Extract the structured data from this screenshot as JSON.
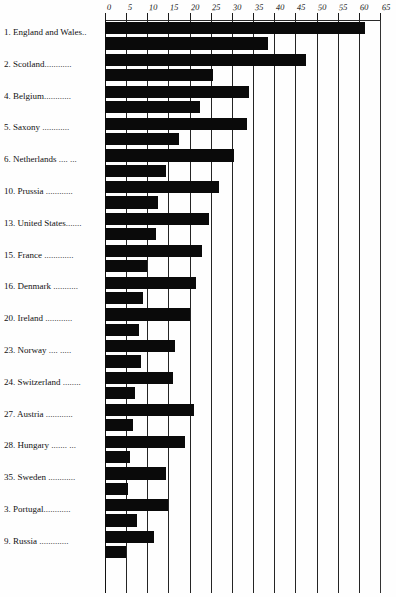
{
  "chart_data": {
    "type": "bar",
    "orientation": "horizontal",
    "title": "",
    "subtitle": "",
    "xlabel": "",
    "ylabel": "",
    "xlim": [
      0,
      65
    ],
    "grid": true,
    "legend_position": "none",
    "axis_ticks": [
      0,
      5,
      10,
      15,
      20,
      25,
      30,
      35,
      40,
      45,
      50,
      55,
      60,
      65
    ],
    "tick_labels": [
      "0",
      "5",
      "10",
      "15",
      "20",
      "25",
      "30",
      "35",
      "40",
      "45",
      "50",
      "55",
      "60",
      "65"
    ],
    "categories": [
      "England and Wales..",
      "Scotland............",
      "Belgium............",
      "Saxony ............",
      "Netherlands .... ...",
      "Prussia ............",
      "United States.......",
      "France .............",
      "Denmark ...........",
      "Ireland ............",
      "Norway .... .....",
      "Switzerland ........",
      "Austria ............",
      "Hungary ....... ...",
      "Sweden ............",
      "Portugal............",
      "Russia ............."
    ],
    "rank_numbers": [
      "1.",
      "2.",
      "4.",
      "5.",
      "6.",
      "10.",
      "13.",
      "15.",
      "16.",
      "20.",
      "23.",
      "24.",
      "27.",
      "28.",
      "35.",
      "3.",
      "9."
    ],
    "series": [
      {
        "name": "upper",
        "values": [
          61.5,
          47.5,
          34.0,
          33.5,
          30.5,
          27.0,
          24.5,
          23.0,
          21.5,
          20.0,
          16.5,
          16.0,
          21.0,
          19.0,
          14.5,
          15.0,
          11.5
        ]
      },
      {
        "name": "lower",
        "values": [
          38.5,
          25.5,
          22.5,
          17.5,
          14.5,
          12.5,
          12.0,
          10.0,
          9.0,
          8.0,
          8.5,
          7.0,
          6.5,
          6.0,
          5.5,
          7.5,
          5.0
        ]
      }
    ]
  },
  "rows": [
    {
      "num": "1.",
      "name": "England and Wales..",
      "v1": 61.5,
      "v2": 38.5
    },
    {
      "num": "2.",
      "name": "Scotland............",
      "v1": 47.5,
      "v2": 25.5
    },
    {
      "num": "4.",
      "name": "Belgium............",
      "v1": 34.0,
      "v2": 22.5
    },
    {
      "num": "5.",
      "name": "Saxony ............",
      "v1": 33.5,
      "v2": 17.5
    },
    {
      "num": "6.",
      "name": "Netherlands .... ...",
      "v1": 30.5,
      "v2": 14.5
    },
    {
      "num": "10.",
      "name": "Prussia ............",
      "v1": 27.0,
      "v2": 12.5
    },
    {
      "num": "13.",
      "name": "United States.......",
      "v1": 24.5,
      "v2": 12.0
    },
    {
      "num": "15.",
      "name": "France .............",
      "v1": 23.0,
      "v2": 10.0
    },
    {
      "num": "16.",
      "name": "Denmark ...........",
      "v1": 21.5,
      "v2": 9.0
    },
    {
      "num": "20.",
      "name": "Ireland ............",
      "v1": 20.0,
      "v2": 8.0
    },
    {
      "num": "23.",
      "name": "Norway .... .....",
      "v1": 16.5,
      "v2": 8.5
    },
    {
      "num": "24.",
      "name": "Switzerland ........",
      "v1": 16.0,
      "v2": 7.0
    },
    {
      "num": "27.",
      "name": "Austria ............",
      "v1": 21.0,
      "v2": 6.5
    },
    {
      "num": "28.",
      "name": "Hungary ....... ...",
      "v1": 19.0,
      "v2": 6.0
    },
    {
      "num": "35.",
      "name": "Sweden ............",
      "v1": 14.5,
      "v2": 5.5
    },
    {
      "num": "3.",
      "name": "Portugal............",
      "v1": 15.0,
      "v2": 7.5
    },
    {
      "num": "9.",
      "name": "Russia .............",
      "v1": 11.5,
      "v2": 5.0
    }
  ],
  "colors": {
    "bar": "#0a0a0a",
    "grid": "#242424",
    "text": "#121212",
    "background": "#ffffff"
  }
}
